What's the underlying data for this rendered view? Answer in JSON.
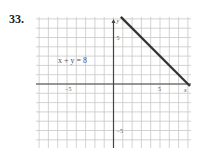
{
  "problem": {
    "number": "33."
  },
  "chart_data": {
    "type": "line",
    "title": "",
    "equation_label": "x + y = 8",
    "xlabel": "x",
    "ylabel": "y",
    "xlim": [
      -8.3,
      8.3
    ],
    "ylim": [
      -6.9,
      7.2
    ],
    "grid": true,
    "x_ticks": [
      {
        "value": -5,
        "label": "−5"
      },
      {
        "value": 5,
        "label": "5"
      }
    ],
    "y_ticks": [
      {
        "value": 5,
        "label": "5"
      },
      {
        "value": -5,
        "label": "−5"
      }
    ],
    "series": [
      {
        "name": "x + y = 8",
        "x": [
          1,
          8
        ],
        "y": [
          7,
          0
        ],
        "arrows": "both"
      }
    ]
  }
}
